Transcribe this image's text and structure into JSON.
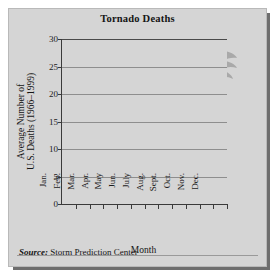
{
  "figure": {
    "title": "Tornado Deaths",
    "source_prefix": "Source:",
    "source_text": "Storm Prediction Center",
    "decorative_icon": "tornado-funnel-icon"
  },
  "chart_data": {
    "type": "bar",
    "title": "Tornado Deaths",
    "xlabel": "Month",
    "ylabel": "Average Number of U.S. Deaths (1966–1999)",
    "ylabel_line1": "Average Number of",
    "ylabel_line2": "U.S. Deaths (1966–1999)",
    "categories": [
      "Jan.",
      "Feb.",
      "Mar.",
      "Apr.",
      "May",
      "Jun.",
      "July",
      "Aug.",
      "Sept.",
      "Oct.",
      "Nov.",
      "Dec."
    ],
    "values": [
      2,
      6.5,
      14,
      25,
      14,
      5.5,
      1,
      3,
      1,
      2,
      4,
      2
    ],
    "ylim": [
      0,
      30
    ],
    "yticks": [
      0,
      5,
      10,
      15,
      20,
      25,
      30
    ],
    "ytick_labels": [
      "0",
      "5",
      "10",
      "15",
      "20",
      "25",
      "30"
    ],
    "grid": true,
    "grid_axis": "y",
    "legend": false,
    "bar_color": "#4a4a4a",
    "plot_background": "#d5d5d5"
  }
}
